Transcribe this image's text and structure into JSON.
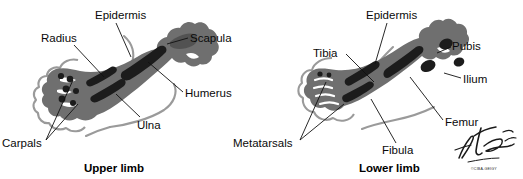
{
  "figure": {
    "type": "anatomical-illustration",
    "background_color": "#ffffff",
    "colors": {
      "mesenchyme": "#6f6f6f",
      "bone": "#1c1c1c",
      "epidermis_line": "#9a9a9a",
      "leader_line": "#111111",
      "text": "#0a0a0a"
    }
  },
  "panels": [
    {
      "id": "upper-limb",
      "title": "Upper limb",
      "title_pos": {
        "x": 84,
        "y": 162
      },
      "labels": [
        {
          "name": "epidermis",
          "text": "Epidermis",
          "x": 95,
          "y": 9
        },
        {
          "name": "radius",
          "text": "Radius",
          "x": 41,
          "y": 32
        },
        {
          "name": "scapula",
          "text": "Scapula",
          "x": 190,
          "y": 32
        },
        {
          "name": "humerus",
          "text": "Humerus",
          "x": 185,
          "y": 87
        },
        {
          "name": "ulna",
          "text": "Ulna",
          "x": 137,
          "y": 119
        },
        {
          "name": "carpals",
          "text": "Carpals",
          "x": 2,
          "y": 137
        }
      ]
    },
    {
      "id": "lower-limb",
      "title": "Lower limb",
      "title_pos": {
        "x": 359,
        "y": 162
      },
      "labels": [
        {
          "name": "epidermis",
          "text": "Epidermis",
          "x": 366,
          "y": 9
        },
        {
          "name": "tibia",
          "text": "Tibia",
          "x": 313,
          "y": 47
        },
        {
          "name": "pubis",
          "text": "Pubis",
          "x": 452,
          "y": 40
        },
        {
          "name": "ilium",
          "text": "Ilium",
          "x": 463,
          "y": 73
        },
        {
          "name": "femur",
          "text": "Femur",
          "x": 445,
          "y": 116
        },
        {
          "name": "fibula",
          "text": "Fibula",
          "x": 382,
          "y": 144
        },
        {
          "name": "metatarsals",
          "text": "Metatarsals",
          "x": 233,
          "y": 137
        }
      ]
    }
  ],
  "signature": {
    "artist": "F. Netter M.D.",
    "copyright": "©CIBA-GEIGY"
  }
}
